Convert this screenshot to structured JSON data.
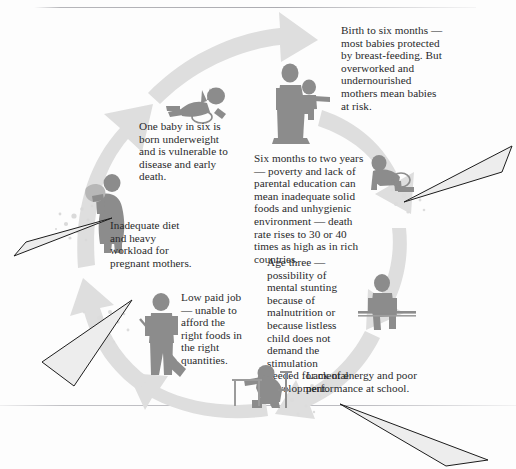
{
  "diagram": {
    "type": "cycle-diagram",
    "colors": {
      "background": "#fdfdfd",
      "arrow_ring": "#dcdcdc",
      "figure": "#8c8c8c",
      "figure_light": "#a3a3a3",
      "text": "#29292b",
      "pointer_fill": "#e9e9e9",
      "pointer_stroke": "#1c1c1c",
      "rule": "#b0b0b6"
    },
    "stages": [
      {
        "id": "underweight-birth",
        "order": 1,
        "icon": "baby-lying-figure",
        "text": "One baby in six is\nborn underweight\nand is vulnerable to\ndisease and early\ndeath."
      },
      {
        "id": "birth-to-six-months",
        "order": 2,
        "icon": "mother-holding-baby-figure",
        "text": "Birth to six months —\nmost babies protected\nby breast-feeding. But\noverworked and\nundernourished\nmothers mean babies\nat risk."
      },
      {
        "id": "six-months-to-two-years",
        "order": 3,
        "icon": "crawling-toddler-figure",
        "text": "Six months to two years\n— poverty and lack of\nparental education can\nmean inadequate solid\nfoods and unhygienic\nenvironment — death\nrate rises to 30 or 40\ntimes as high as in rich\ncountries."
      },
      {
        "id": "age-three",
        "order": 4,
        "icon": "seated-child-figure",
        "text": "Age three —\npossibility of\nmental stunting\nbecause of\nmalnutrition or\nbecause listless\nchild does not\ndemand the\nstimulation\nneeded for mental\ndevelopment."
      },
      {
        "id": "school-performance",
        "order": 5,
        "icon": "child-at-desk-figure",
        "text": "Lack of energy and poor\nperformance at school."
      },
      {
        "id": "low-paid-job",
        "order": 6,
        "icon": "worker-with-shovel-figure",
        "text": "Low paid job\n— unable to\nafford the\nright foods in\nthe right\nquantities."
      },
      {
        "id": "pregnant-mother",
        "order": 7,
        "icon": "pregnant-woman-carrying-load-figure",
        "text": "Inadequate diet\nand heavy\nworkload for\npregnant mothers."
      }
    ],
    "pointers": [
      {
        "id": "pointer-left-upper",
        "direction": "points-up-right"
      },
      {
        "id": "pointer-left-lower",
        "direction": "points-up-right"
      },
      {
        "id": "pointer-right-upper",
        "direction": "points-down-left"
      },
      {
        "id": "pointer-bottom-right",
        "direction": "points-up-left"
      }
    ]
  }
}
